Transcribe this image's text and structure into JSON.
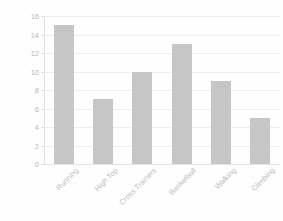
{
  "chart_data": {
    "type": "bar",
    "title": "",
    "xlabel": "",
    "ylabel": "Count",
    "categories": [
      "Running",
      "High Top",
      "Cross Trainers",
      "Basketball",
      "Walking",
      "Climbing"
    ],
    "values": [
      15,
      7,
      10,
      13,
      9,
      5
    ],
    "ylim": [
      0,
      16
    ],
    "ytick_step": 2,
    "yticks": [
      "16",
      "14",
      "12",
      "10",
      "8",
      "6",
      "4",
      "2",
      "0"
    ],
    "ytick_values": [
      16,
      14,
      12,
      10,
      8,
      6,
      4,
      2,
      0
    ],
    "grid": true,
    "legend": false,
    "legend_position": "none",
    "bar_color": "#c6c6c6",
    "gridline_color": "#ededed",
    "tick_label_color": "#b9b9b9",
    "axis_title_color": "#4a4a4a",
    "xtick_rotation": -45,
    "series": [
      {
        "name": "Count",
        "values": [
          15,
          7,
          10,
          13,
          9,
          5
        ]
      }
    ]
  }
}
